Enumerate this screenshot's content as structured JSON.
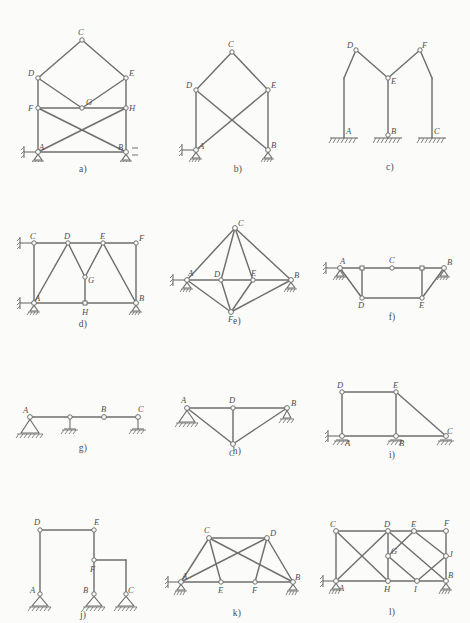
{
  "figure": {
    "panel_count": 12
  },
  "panels": [
    {
      "id": "a",
      "caption": "a)",
      "nodes": [
        "A",
        "B",
        "C",
        "D",
        "E",
        "F",
        "G",
        "H"
      ],
      "supports": [
        "roller-with-horizontal-link at A",
        "roller at B"
      ],
      "description": "Two-storey frame: columns A-D and B-E, floor beam F-H with X-bracing to A and B, upper roof D-C-E with inner chords D-G-E."
    },
    {
      "id": "b",
      "caption": "b)",
      "nodes": [
        "A",
        "B",
        "C",
        "D",
        "E"
      ],
      "supports": [
        "roller-with-horizontal-link at A",
        "roller at B"
      ],
      "description": "Gable frame: columns A-D and B-E, roof D-C-E, cross diagonals D-B and E-A."
    },
    {
      "id": "c",
      "caption": "c)",
      "nodes": [
        "A",
        "B",
        "C",
        "D",
        "E",
        "F"
      ],
      "supports": [
        "fixed base at A",
        "fixed base at B",
        "fixed base at C"
      ],
      "description": "Three-column frame with two gables: A-D-E and C-F-E, centre column B-E, hinges at D, E and F."
    },
    {
      "id": "d",
      "caption": "d)",
      "nodes": [
        "A",
        "B",
        "C",
        "D",
        "E",
        "F",
        "G",
        "H"
      ],
      "supports": [
        "roller-with-horizontal-link at C",
        "roller at A",
        "roller at B"
      ],
      "description": "Rectangular frame A-C-F-B with internal W-truss A-D-G-E-B and vertical hanger G-H."
    },
    {
      "id": "e",
      "caption": "e)",
      "nodes": [
        "A",
        "B",
        "C",
        "D",
        "E",
        "F"
      ],
      "supports": [
        "roller-with-horizontal-link at A",
        "roller at B"
      ],
      "description": "Rhombic truss A-C-B-F with horizontal chord A-D-E-B and internal members C-D, C-E, D-F, E-F."
    },
    {
      "id": "f",
      "caption": "f)",
      "nodes": [
        "A",
        "B",
        "C",
        "D",
        "E"
      ],
      "supports": [
        "roller-with-horizontal-link at A",
        "roller at B"
      ],
      "description": "Trapezoidal truss: top chord A-C-B with hinges, bottom chord D-E, verticals and inclined end posts A-D, B-E."
    },
    {
      "id": "g",
      "caption": "g)",
      "nodes": [
        "A",
        "B",
        "C"
      ],
      "supports": [
        "pinned support at A",
        "roller at mid span",
        "roller at C"
      ],
      "description": "Continuous multi-span beam A-B-C with an intermediate hinge at B."
    },
    {
      "id": "h",
      "caption": "h)",
      "nodes": [
        "A",
        "B",
        "C",
        "D"
      ],
      "supports": [
        "pinned support at A",
        "roller at B"
      ],
      "description": "Straight top chord A-D-B with apex C below and members A-C, C-B, vertical D-C."
    },
    {
      "id": "i",
      "caption": "i)",
      "nodes": [
        "A",
        "B",
        "C",
        "D",
        "E"
      ],
      "supports": [
        "roller-with-horizontal-link at A",
        "roller at B",
        "roller at C"
      ],
      "description": "Frame with rectangular panel A-D-E-B and inclined member E-C to third support."
    },
    {
      "id": "j",
      "caption": "j)",
      "nodes": [
        "A",
        "B",
        "C",
        "D",
        "E",
        "F"
      ],
      "supports": [
        "pinned support at A",
        "pinned support at B",
        "pinned support at C"
      ],
      "description": "Stepped frame: tall column A-D with beam D-E, column E-B through hinge F and short beam F-C."
    },
    {
      "id": "k",
      "caption": "k)",
      "nodes": [
        "A",
        "B",
        "C",
        "D",
        "E",
        "F"
      ],
      "supports": [
        "roller-with-horizontal-link at A",
        "roller at B"
      ],
      "description": "Truss with bottom chord A-E-F-B, upper nodes C and D, crossed long diagonals C-B and A-D."
    },
    {
      "id": "l",
      "caption": "l)",
      "nodes": [
        "A",
        "B",
        "C",
        "D",
        "E",
        "F",
        "G",
        "H",
        "I",
        "J"
      ],
      "supports": [
        "roller-with-horizontal-link at A",
        "roller at B"
      ],
      "description": "Compound truss: left panel A-C-D-H with X-bracing, right diamond panel E-G-I-J and end panel F-B."
    }
  ]
}
